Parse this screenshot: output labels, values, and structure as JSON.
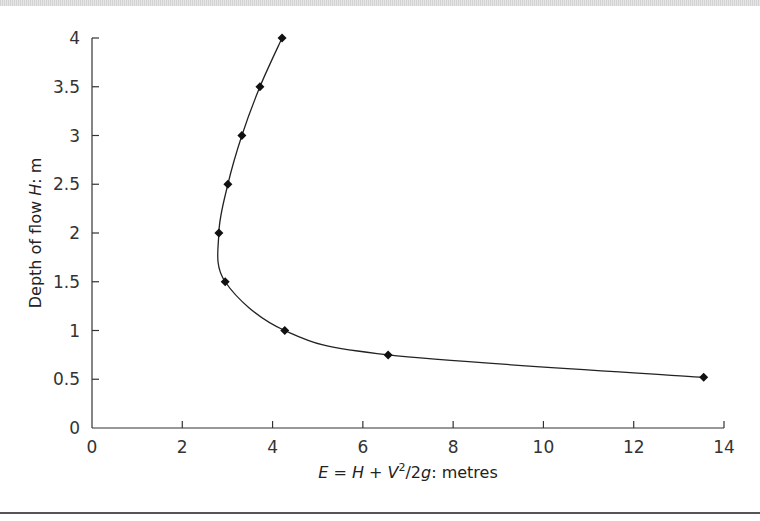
{
  "chart_data": {
    "type": "line",
    "title": "",
    "xlabel": "E = H + V²/2g: metres",
    "ylabel": "Depth of flow H: m",
    "xlim": [
      0,
      14
    ],
    "ylim": [
      0,
      4
    ],
    "xticks": [
      0,
      2,
      4,
      6,
      8,
      10,
      12,
      14
    ],
    "yticks": [
      0,
      0.5,
      1,
      1.5,
      2,
      2.5,
      3,
      3.5,
      4
    ],
    "xtick_labels": [
      "0",
      "2",
      "4",
      "6",
      "8",
      "10",
      "12",
      "14"
    ],
    "ytick_labels": [
      "0",
      "0.5",
      "1",
      "1.5",
      "2",
      "2.5",
      "3",
      "3.5",
      "4"
    ],
    "grid": false,
    "legend": "none",
    "series": [
      {
        "name": "Specific energy curve",
        "marker": "diamond",
        "smooth": true,
        "x": [
          13.55,
          6.56,
          4.27,
          2.95,
          2.81,
          3.01,
          3.32,
          3.72,
          4.21
        ],
        "y": [
          0.52,
          0.75,
          1.0,
          1.5,
          2.0,
          2.5,
          3.0,
          3.5,
          4.0
        ]
      }
    ]
  },
  "labels": {
    "xlabel_E": "E",
    "xlabel_eq": " = ",
    "xlabel_H": "H",
    "xlabel_plus": " + ",
    "xlabel_V": "V",
    "xlabel_sup": "2",
    "xlabel_slash": "/2",
    "xlabel_g": "g",
    "xlabel_rest": ": metres",
    "ylabel_pre": "Depth of flow ",
    "ylabel_H": "H",
    "ylabel_rest": ": m"
  }
}
